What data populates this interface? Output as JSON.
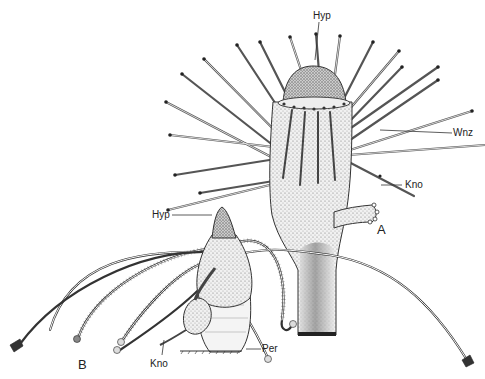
{
  "figure": {
    "panels": [
      {
        "id": "A",
        "label": "A",
        "annotations": [
          {
            "key": "hyp",
            "text": "Hyp"
          },
          {
            "key": "wnz",
            "text": "Wnz"
          },
          {
            "key": "kno",
            "text": "Kno"
          }
        ]
      },
      {
        "id": "B",
        "label": "B",
        "annotations": [
          {
            "key": "hyp",
            "text": "Hyp"
          },
          {
            "key": "kno",
            "text": "Kno"
          },
          {
            "key": "per",
            "text": "Per"
          }
        ]
      }
    ],
    "colors": {
      "ink": "#222222",
      "background": "#ffffff",
      "stipple": "#9a9a9a"
    }
  }
}
